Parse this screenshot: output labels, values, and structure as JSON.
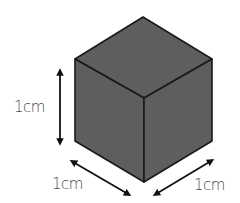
{
  "diagram": {
    "type": "isometric-cube",
    "colors": {
      "face_fill": "#5e5e5e",
      "edge_stroke": "#1a1a1a",
      "arrow": "#111111",
      "label_text": "#4a4a4a",
      "background": "#ffffff"
    },
    "labels": {
      "height": "1cm",
      "depth_left": "1cm",
      "width_right": "1cm"
    },
    "dimensions": [
      {
        "name": "height",
        "value": "1cm",
        "orientation": "vertical"
      },
      {
        "name": "depth",
        "value": "1cm",
        "orientation": "diagonal-left"
      },
      {
        "name": "width",
        "value": "1cm",
        "orientation": "diagonal-right"
      }
    ]
  }
}
